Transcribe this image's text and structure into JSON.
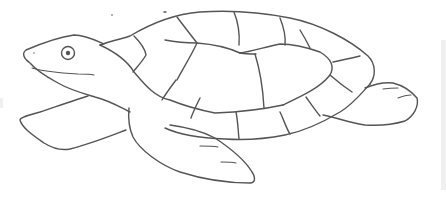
{
  "image": {
    "subject": "sea turtle line drawing",
    "style": "pencil sketch",
    "background_color": "#ffffff",
    "stroke_color": "#555555",
    "parts": [
      "head",
      "eye",
      "mouth",
      "shell",
      "shell-scutes",
      "front-left-flipper",
      "front-right-flipper",
      "rear-flipper"
    ]
  }
}
